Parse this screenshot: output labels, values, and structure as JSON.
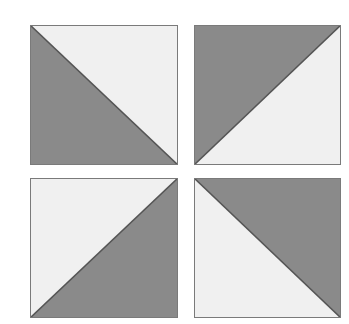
{
  "figure": {
    "background_color": "#ffffff",
    "canvas": {
      "width": 349,
      "height": 324
    },
    "colors": {
      "shaded": "#8a8a8a",
      "unshaded": "#f0f0f0",
      "diagonal_line": "#555555",
      "square_border": "#7a7a7a",
      "background": "#ffffff"
    },
    "grid": {
      "rows": 2,
      "columns": 2,
      "column_gap_px": 16,
      "row_gap_px": 13
    },
    "tiles": [
      {
        "id": "tile-top-left",
        "position": "top-left",
        "x": 30,
        "y": 25,
        "width": 148,
        "height": 140,
        "diagonal": "top-left-to-bottom-right",
        "shaded_half": "lower-left",
        "unshaded_half": "upper-right",
        "shaded_fraction": "1/2"
      },
      {
        "id": "tile-top-right",
        "position": "top-right",
        "x": 194,
        "y": 25,
        "width": 147,
        "height": 140,
        "diagonal": "bottom-left-to-top-right",
        "shaded_half": "upper-left",
        "unshaded_half": "lower-right",
        "shaded_fraction": "1/2"
      },
      {
        "id": "tile-bottom-left",
        "position": "bottom-left",
        "x": 30,
        "y": 178,
        "width": 148,
        "height": 140,
        "diagonal": "bottom-left-to-top-right",
        "shaded_half": "lower-right",
        "unshaded_half": "upper-left",
        "shaded_fraction": "1/2"
      },
      {
        "id": "tile-bottom-right",
        "position": "bottom-right",
        "x": 194,
        "y": 178,
        "width": 147,
        "height": 140,
        "diagonal": "top-left-to-bottom-right",
        "shaded_half": "upper-right",
        "unshaded_half": "lower-left",
        "shaded_fraction": "1/2"
      }
    ]
  }
}
